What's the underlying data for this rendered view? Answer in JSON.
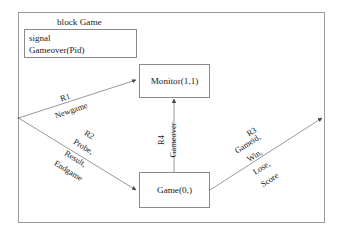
{
  "frame": {
    "title": "block Game",
    "signal_box": {
      "keyword": "signal",
      "declaration": "Gameover(Pid)"
    }
  },
  "blocks": [
    {
      "id": "monitor",
      "label": "Monitor(1,1)"
    },
    {
      "id": "game",
      "label": "Game(0,)"
    }
  ],
  "channels": [
    {
      "id": "r1",
      "name": "R1",
      "signals": [
        "Newgame"
      ],
      "from": "frame-left-gate",
      "to": "monitor"
    },
    {
      "id": "r2",
      "name": "R2",
      "signals": [
        "Probe,",
        "Result,",
        "Endgame"
      ],
      "from": "frame-left-gate",
      "to": "game"
    },
    {
      "id": "r3",
      "name": "R3",
      "signals": [
        "Gameid,",
        "Win,",
        "Lose,",
        "Score"
      ],
      "from": "game",
      "to": "frame-right-gate"
    },
    {
      "id": "r4",
      "name": "R4",
      "signals": [
        "Gameover"
      ],
      "from": "game",
      "to": "monitor"
    }
  ],
  "colors": {
    "line": "#888888",
    "box_border": "#8a8a8a",
    "frame_border": "#9a9a9a",
    "text": "#1a1a1a",
    "background": "#ffffff"
  }
}
